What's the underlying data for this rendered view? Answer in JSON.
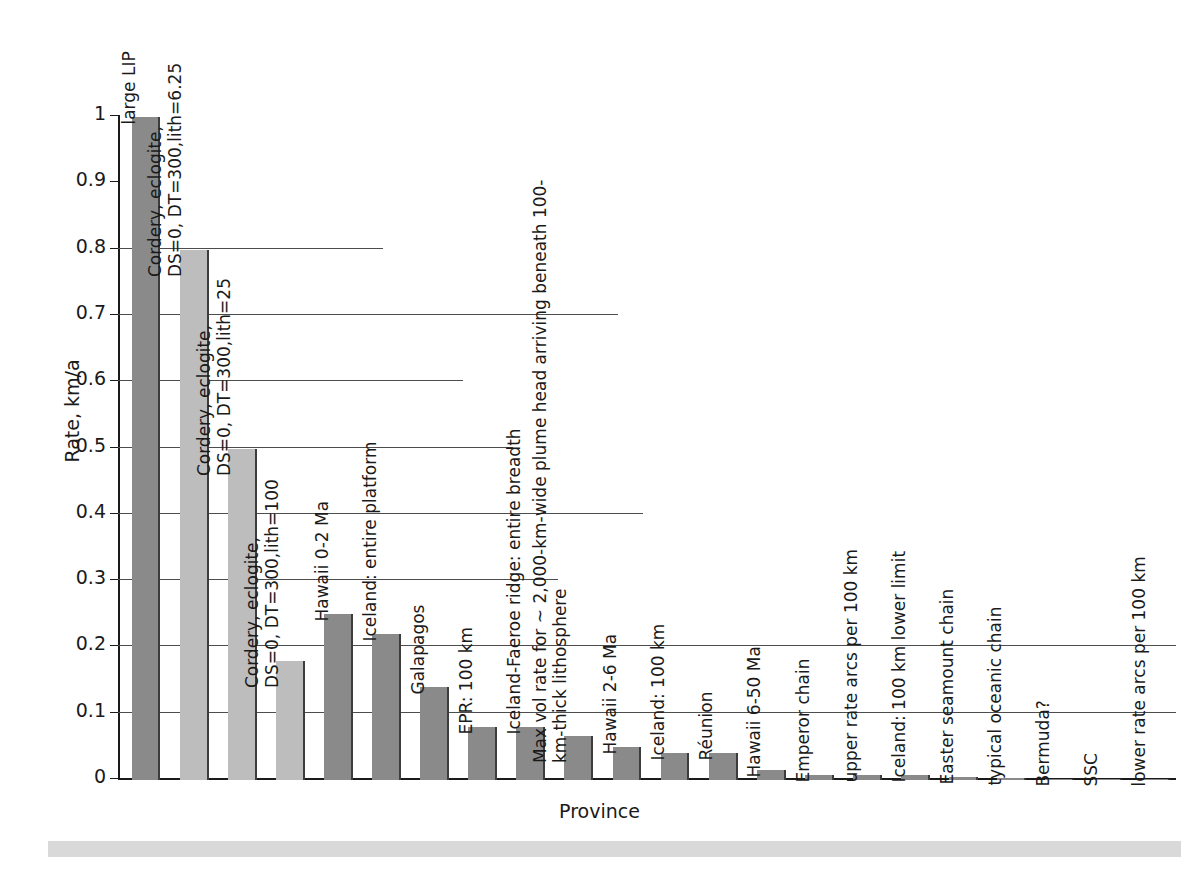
{
  "chart_data": {
    "type": "bar",
    "title": "",
    "xlabel": "Province",
    "ylabel": "Rate, km/a",
    "ylim": [
      0,
      1
    ],
    "grid": true,
    "legend": "none",
    "ytick_labels": [
      "1",
      "0.9",
      "0.8",
      "0.7",
      "0.6",
      "0.5",
      "0.4",
      "0.3",
      "0.2",
      "0.1",
      "0"
    ],
    "ytick_values": [
      1,
      0.9,
      0.8,
      0.7,
      0.6,
      0.5,
      0.4,
      0.3,
      0.2,
      0.1,
      0
    ],
    "categories": [
      "large LIP",
      "Cordery, eclogite,\nDS=0, DT=300,lith=6.25",
      "Cordery, eclogite,\nDS=0, DT=300,lith=25",
      "Cordery, eclogite,\nDS=0, DT=300,lith=100",
      "Hawaii 0-2 Ma",
      "Iceland: entire platform",
      "Galapagos",
      "EPR: 100 km",
      "Iceland-Faeroe ridge: entire breadth",
      "Max vol rate for ~ 2,000-km-wide plume head arriving beneath 100-\nkm-thick lithosphere",
      "Hawaii 2-6 Ma",
      "Iceland: 100 km",
      "Réunion",
      "Hawaii 6-50 Ma",
      "Emperor chain",
      "upper rate arcs per 100 km",
      "Iceland: 100 km lower limit",
      "Easter seamount chain",
      "typical oceanic chain",
      "Bermuda?",
      "SSC",
      "lower rate arcs per 100 km"
    ],
    "values": [
      1.0,
      0.8,
      0.5,
      0.18,
      0.25,
      0.22,
      0.14,
      0.08,
      0.08,
      0.067,
      0.05,
      0.04,
      0.04,
      0.015,
      0.008,
      0.007,
      0.007,
      0.004,
      0.003,
      0.001,
      0.0008,
      0.0006
    ],
    "bar_colors": [
      "#8a8a8a",
      "#bdbdbd",
      "#bdbdbd",
      "#bdbdbd",
      "#8a8a8a",
      "#8a8a8a",
      "#8a8a8a",
      "#8a8a8a",
      "#8a8a8a",
      "#8a8a8a",
      "#8a8a8a",
      "#8a8a8a",
      "#8a8a8a",
      "#8a8a8a",
      "#8a8a8a",
      "#8a8a8a",
      "#8a8a8a",
      "#8a8a8a",
      "#8a8a8a",
      "#8a8a8a",
      "#8a8a8a",
      "#8a8a8a"
    ]
  },
  "colors": {
    "bar_dark": "#8a8a8a",
    "bar_light": "#bdbdbd",
    "bar_edge": "#3c3c3c",
    "axis": "#1a1a1a",
    "grid": "#4d4d4d",
    "background": "#ffffff",
    "bottom_strip": "#d9d9d9"
  }
}
